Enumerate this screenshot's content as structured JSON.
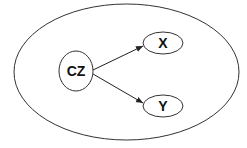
{
  "diagram": {
    "type": "causal-graph",
    "nodes": [
      {
        "id": "cz",
        "label": "CZ"
      },
      {
        "id": "x",
        "label": "X"
      },
      {
        "id": "y",
        "label": "Y"
      }
    ],
    "edges": [
      {
        "from": "CZ",
        "to": "X"
      },
      {
        "from": "CZ",
        "to": "Y"
      }
    ],
    "colors": {
      "stroke": "#222222",
      "background": "#ffffff"
    }
  }
}
